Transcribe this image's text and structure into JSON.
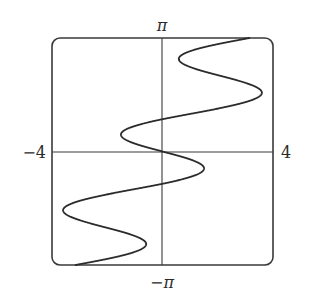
{
  "chart_data": {
    "type": "line",
    "title": "",
    "xlabel": "",
    "ylabel": "",
    "function": {
      "form": "x = y - a*sin(k*y)",
      "a": 2,
      "k": 3
    },
    "xlim": [
      -4,
      4
    ],
    "ylim": [
      -3.14159,
      3.14159
    ],
    "grid": false,
    "axes_through_origin": true,
    "frame": "rounded-box",
    "tick_labels": {
      "x_min": "−4",
      "x_max": "4",
      "y_max": "π",
      "y_min": "−π"
    },
    "series": [
      {
        "name": "curve",
        "points_y_x": [
          [
            -3.1416,
            -3.1416
          ],
          [
            -3.0107,
            -2.245
          ],
          [
            -2.8798,
            -1.466
          ],
          [
            -2.7489,
            -0.901
          ],
          [
            -2.618,
            -0.618
          ],
          [
            -2.4871,
            -0.639
          ],
          [
            -2.3562,
            -0.942
          ],
          [
            -2.2253,
            -1.46
          ],
          [
            -2.0944,
            -2.0944
          ],
          [
            -1.9635,
            -2.729
          ],
          [
            -1.8326,
            -3.247
          ],
          [
            -1.7017,
            -3.55
          ],
          [
            -1.5708,
            -3.571
          ],
          [
            -1.4399,
            -3.288
          ],
          [
            -1.309,
            -2.723
          ],
          [
            -1.1781,
            -1.944
          ],
          [
            -1.0472,
            -1.0472
          ],
          [
            -0.9163,
            -0.151
          ],
          [
            -0.7854,
            0.629
          ],
          [
            -0.6545,
            1.193
          ],
          [
            -0.5236,
            1.476
          ],
          [
            -0.3927,
            1.455
          ],
          [
            -0.2618,
            1.152
          ],
          [
            -0.1309,
            0.634
          ],
          [
            0,
            0
          ],
          [
            0.1309,
            -0.634
          ],
          [
            0.2618,
            -1.152
          ],
          [
            0.3927,
            -1.455
          ],
          [
            0.5236,
            -1.476
          ],
          [
            0.6545,
            -1.193
          ],
          [
            0.7854,
            -0.629
          ],
          [
            0.9163,
            0.151
          ],
          [
            1.0472,
            1.0472
          ],
          [
            1.1781,
            1.944
          ],
          [
            1.309,
            2.723
          ],
          [
            1.4399,
            3.288
          ],
          [
            1.5708,
            3.571
          ],
          [
            1.7017,
            3.55
          ],
          [
            1.8326,
            3.247
          ],
          [
            1.9635,
            2.729
          ],
          [
            2.0944,
            2.0944
          ],
          [
            2.2253,
            1.46
          ],
          [
            2.3562,
            0.942
          ],
          [
            2.4871,
            0.639
          ],
          [
            2.618,
            0.618
          ],
          [
            2.7489,
            0.901
          ],
          [
            2.8798,
            1.466
          ],
          [
            3.0107,
            2.245
          ],
          [
            3.1416,
            3.1416
          ]
        ]
      }
    ]
  },
  "colors": {
    "frame": "#3a3a3a",
    "axes": "#3a3a3a",
    "curve": "#2b2b2b",
    "background": "#ffffff"
  }
}
